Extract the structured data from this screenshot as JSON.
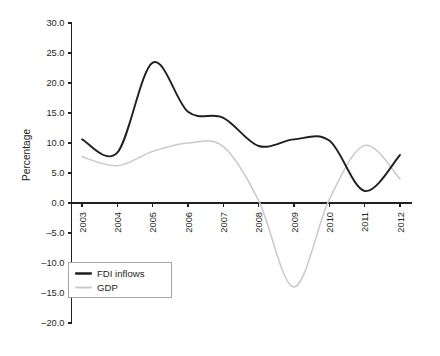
{
  "chart_data": {
    "type": "line",
    "title": "",
    "xlabel": "",
    "ylabel": "Percentage",
    "x": [
      2003,
      2004,
      2005,
      2006,
      2007,
      2008,
      2009,
      2010,
      2011,
      2012
    ],
    "xtick_labels": [
      "2003",
      "2004",
      "2005",
      "2006",
      "2007",
      "2008",
      "2009",
      "2010",
      "2011",
      "2012"
    ],
    "ytick_labels": [
      "30.0",
      "25.0",
      "20.0",
      "15.0",
      "10.0",
      "5.0",
      "0.0",
      "–5.0",
      "–10.0",
      "–15.0",
      "–20.0"
    ],
    "ytick_values": [
      30,
      25,
      20,
      15,
      10,
      5,
      0,
      -5,
      -10,
      -15,
      -20
    ],
    "ylim": [
      -20,
      30
    ],
    "grid": false,
    "legend_position": "bottom-left",
    "series": [
      {
        "name": "FDI inflows",
        "color": "#231f20",
        "width": 1.9,
        "values": [
          10.6,
          8.4,
          23.4,
          15.2,
          14.2,
          9.5,
          10.6,
          10.4,
          2.0,
          8.0
        ]
      },
      {
        "name": "GDP",
        "color": "#c9c9c9",
        "width": 1.5,
        "values": [
          7.7,
          6.2,
          8.6,
          10.0,
          9.4,
          0.4,
          -14.0,
          0.6,
          9.6,
          4.0
        ]
      }
    ]
  }
}
